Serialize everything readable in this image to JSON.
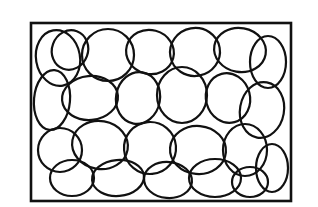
{
  "drawing": {
    "description": "Scribble of overlapping loops inside a rectangular frame",
    "stroke_color": "#111111",
    "background": "#ffffff",
    "frame": {
      "x": 31,
      "y": 23,
      "width": 260,
      "height": 178
    },
    "loops": [
      {
        "cx": 58,
        "cy": 58,
        "rx": 22,
        "ry": 28,
        "rot": -10
      },
      {
        "cx": 70,
        "cy": 50,
        "rx": 18,
        "ry": 20,
        "rot": 20
      },
      {
        "cx": 108,
        "cy": 55,
        "rx": 26,
        "ry": 26,
        "rot": 0
      },
      {
        "cx": 150,
        "cy": 52,
        "rx": 24,
        "ry": 22,
        "rot": 15
      },
      {
        "cx": 195,
        "cy": 52,
        "rx": 25,
        "ry": 24,
        "rot": -10
      },
      {
        "cx": 240,
        "cy": 50,
        "rx": 26,
        "ry": 22,
        "rot": 10
      },
      {
        "cx": 268,
        "cy": 62,
        "rx": 18,
        "ry": 26,
        "rot": 0
      },
      {
        "cx": 52,
        "cy": 100,
        "rx": 18,
        "ry": 30,
        "rot": 5
      },
      {
        "cx": 90,
        "cy": 98,
        "rx": 28,
        "ry": 22,
        "rot": -5
      },
      {
        "cx": 138,
        "cy": 98,
        "rx": 22,
        "ry": 26,
        "rot": 10
      },
      {
        "cx": 182,
        "cy": 95,
        "rx": 25,
        "ry": 28,
        "rot": 0
      },
      {
        "cx": 228,
        "cy": 98,
        "rx": 22,
        "ry": 25,
        "rot": -15
      },
      {
        "cx": 262,
        "cy": 110,
        "rx": 22,
        "ry": 28,
        "rot": 10
      },
      {
        "cx": 60,
        "cy": 150,
        "rx": 22,
        "ry": 22,
        "rot": 0
      },
      {
        "cx": 100,
        "cy": 145,
        "rx": 28,
        "ry": 24,
        "rot": 10
      },
      {
        "cx": 150,
        "cy": 148,
        "rx": 26,
        "ry": 26,
        "rot": -5
      },
      {
        "cx": 198,
        "cy": 150,
        "rx": 28,
        "ry": 24,
        "rot": 5
      },
      {
        "cx": 245,
        "cy": 150,
        "rx": 22,
        "ry": 26,
        "rot": 0
      },
      {
        "cx": 272,
        "cy": 168,
        "rx": 16,
        "ry": 24,
        "rot": 0
      },
      {
        "cx": 72,
        "cy": 178,
        "rx": 22,
        "ry": 18,
        "rot": 0
      },
      {
        "cx": 118,
        "cy": 178,
        "rx": 26,
        "ry": 18,
        "rot": -5
      },
      {
        "cx": 168,
        "cy": 180,
        "rx": 24,
        "ry": 18,
        "rot": 5
      },
      {
        "cx": 215,
        "cy": 178,
        "rx": 26,
        "ry": 19,
        "rot": 0
      },
      {
        "cx": 250,
        "cy": 182,
        "rx": 18,
        "ry": 15,
        "rot": 0
      }
    ]
  }
}
